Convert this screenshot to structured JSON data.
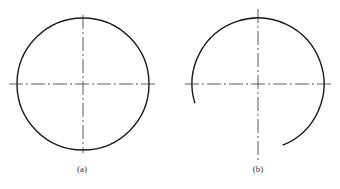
{
  "figures": [
    {
      "id": "a",
      "label": "(a)",
      "description": "full circle with center lines",
      "center": [
        83,
        84
      ],
      "radius": 66,
      "arc": "full",
      "hline": [
        9,
        157
      ],
      "vline": [
        15,
        153
      ],
      "label_pos": [
        82,
        164
      ]
    },
    {
      "id": "b",
      "label": "(b)",
      "description": "open circular arc with center lines",
      "center": [
        258,
        84
      ],
      "radius": 66,
      "arc": {
        "start_deg": 163,
        "end_deg": 68
      },
      "hline": [
        185,
        333
      ],
      "vline": [
        9,
        160
      ],
      "label_pos": [
        258,
        164
      ]
    }
  ],
  "colors": {
    "stroke": "#1a1a1a",
    "centerline": "#333333",
    "background": "#ffffff"
  }
}
